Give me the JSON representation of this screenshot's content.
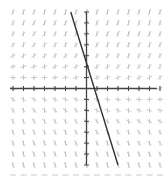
{
  "chart_data": {
    "type": "line",
    "subtype": "slope-field",
    "title": "",
    "xlabel": "",
    "ylabel": "",
    "grid": false,
    "legend": null,
    "xlim": [
      -7,
      7
    ],
    "ylim": [
      -7,
      7
    ],
    "series": [
      {
        "name": "solution-line",
        "x": [
          -1.5,
          3
        ],
        "y": [
          7,
          -7
        ],
        "color": "#333333"
      }
    ],
    "slope_field": {
      "color": "#bbbbbb",
      "rows": 15,
      "cols": 15
    }
  },
  "colors": {
    "axis": "#444444",
    "line": "#333333",
    "field": "#bbbbbb"
  }
}
